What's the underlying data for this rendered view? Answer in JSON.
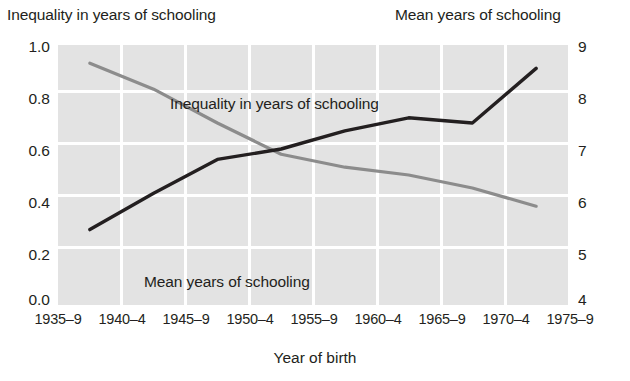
{
  "chart_data": {
    "type": "line",
    "title": "",
    "xlabel": "Year of birth",
    "left_axis_title": "Inequality in years of schooling",
    "right_axis_title": "Mean years of schooling",
    "categories": [
      "1935–9",
      "1940–4",
      "1945–9",
      "1950–4",
      "1955–9",
      "1960–4",
      "1965–9",
      "1970–4",
      "1975–9"
    ],
    "grid": true,
    "legend_position": "inline-annotations",
    "left_axis": {
      "label": "Inequality in years of schooling",
      "ticks": [
        "1.0",
        "0.8",
        "0.6",
        "0.4",
        "0.2",
        "0.0"
      ],
      "tick_values": [
        1.0,
        0.8,
        0.6,
        0.4,
        0.2,
        0.0
      ],
      "ylim": [
        0.0,
        1.0
      ]
    },
    "right_axis": {
      "label": "Mean years of schooling",
      "ticks": [
        "9",
        "8",
        "7",
        "6",
        "5",
        "4"
      ],
      "tick_values": [
        9,
        8,
        7,
        6,
        5,
        4
      ],
      "ylim": [
        4,
        9
      ]
    },
    "series": [
      {
        "name": "Inequality in years of schooling",
        "axis": "left",
        "color": "#8c8c8c",
        "x": [
          "1937",
          "1942",
          "1947",
          "1952",
          "1957",
          "1962",
          "1967",
          "1972"
        ],
        "values": [
          0.93,
          0.83,
          0.7,
          0.58,
          0.53,
          0.5,
          0.45,
          0.38
        ]
      },
      {
        "name": "Mean years of schooling",
        "axis": "right",
        "color": "#231f20",
        "x": [
          "1937",
          "1942",
          "1947",
          "1952",
          "1957",
          "1962",
          "1967",
          "1972"
        ],
        "values": [
          5.45,
          6.15,
          6.8,
          7.0,
          7.35,
          7.6,
          7.5,
          8.55
        ]
      }
    ],
    "annotations": [
      {
        "text": "Inequality in years of schooling",
        "series": "Inequality in years of schooling"
      },
      {
        "text": "Mean years of schooling",
        "series": "Mean years of schooling"
      }
    ]
  },
  "colors": {
    "plot_background": "#e3e3e3",
    "gridline": "#ffffff",
    "inequality_line": "#8c8c8c",
    "mean_line": "#231f20",
    "text": "#231f20"
  }
}
